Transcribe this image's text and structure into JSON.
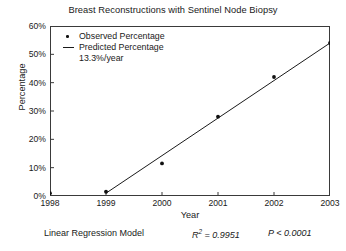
{
  "chart_data": {
    "type": "scatter",
    "title": "Breast Reconstructions with Sentinel Node Biopsy",
    "xlabel": "Year",
    "ylabel": "Percentage",
    "x": [
      1998,
      1999,
      2000,
      2001,
      2002,
      2003
    ],
    "xtick_labels": [
      "1998",
      "1999",
      "2000",
      "2001",
      "2002",
      "2003"
    ],
    "ytick_labels": [
      "0%",
      "10%",
      "20%",
      "30%",
      "40%",
      "50%",
      "60%"
    ],
    "ytick_values": [
      0,
      10,
      20,
      30,
      40,
      50,
      60
    ],
    "xlim": [
      1998,
      2003
    ],
    "ylim": [
      0,
      60
    ],
    "grid": false,
    "legend_position": "top-left",
    "series": [
      {
        "name": "Observed Percentage",
        "type": "scatter",
        "marker": "dot",
        "color": "#111111",
        "values": [
          1.0,
          1.5,
          11.5,
          28.0,
          42.0,
          54.0
        ]
      },
      {
        "name": "Predicted Percentage",
        "type": "line",
        "color": "#1a1a1a",
        "slope_label": "13.3%/year",
        "x": [
          1999,
          2003
        ],
        "values": [
          1.0,
          54.0
        ]
      }
    ],
    "annotations": {
      "model": "Linear Regression Model",
      "r_squared_label": "R",
      "r_squared_sup": "2",
      "r_squared_value": "= 0.9951",
      "p_value": "P < 0.0001"
    }
  },
  "legend": {
    "observed_label": "Observed Percentage",
    "predicted_label": "Predicted Percentage",
    "rate_label": "13.3%/year"
  }
}
